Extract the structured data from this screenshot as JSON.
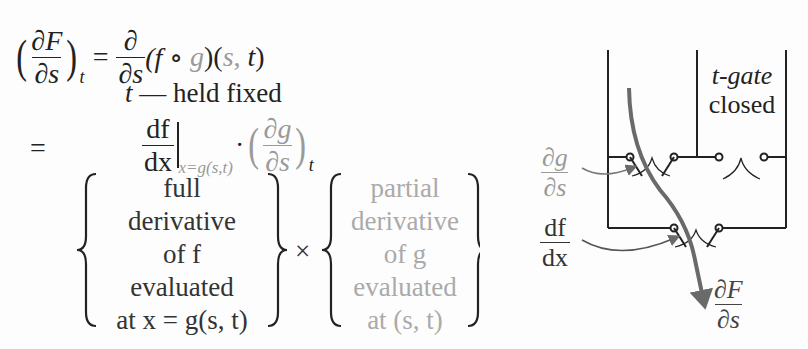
{
  "equation": {
    "line1": {
      "lhs": {
        "numerator": "∂F",
        "denominator": "∂s",
        "subscript": "t"
      },
      "equals": "=",
      "operator": {
        "numerator": "∂",
        "denominator": "∂s"
      },
      "rhs_open": "(f ∘ ",
      "rhs_g": "g",
      "rhs_mid": ")(",
      "rhs_s": "s",
      "rhs_comma": ", ",
      "rhs_t": "t",
      "rhs_close": ")"
    },
    "annotation": {
      "var": "t",
      "text": " — held fixed"
    },
    "line2": {
      "equals": "=",
      "df": {
        "numerator": "df",
        "denominator": "dx"
      },
      "eval_subscript": "x=g(s,t)",
      "dot": "·",
      "dg": {
        "numerator": "∂g",
        "denominator": "∂s",
        "subscript": "t"
      }
    },
    "line3": {
      "left_block": [
        "full",
        "derivative",
        "of f",
        "evaluated",
        "at x = g(s, t)"
      ],
      "times": "×",
      "right_block": [
        "partial",
        "derivative",
        "of g",
        "evaluated",
        "at (s, t)"
      ]
    }
  },
  "diagram": {
    "gate_label_line1": "t-gate",
    "gate_label_line2": "closed",
    "label_dg": {
      "numerator": "∂g",
      "denominator": "∂s"
    },
    "label_df": {
      "numerator": "df",
      "denominator": "dx"
    },
    "label_dF": {
      "numerator": "∂F",
      "denominator": "∂s"
    }
  },
  "colors": {
    "ink": "#222222",
    "gray": "#9a9a9a",
    "arrow": "#6a6a6a"
  }
}
